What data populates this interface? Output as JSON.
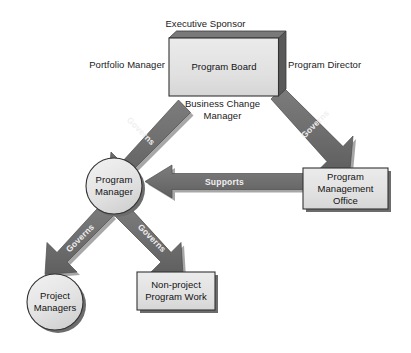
{
  "diagram": {
    "type": "organizational-flow-diagram",
    "colors": {
      "node_fill": "#e2e2e2",
      "node_fill_light": "#ededed",
      "node_border": "#3a3a3a",
      "shadow": "#6e6e6e",
      "arrow": "#706f70",
      "arrow_dark": "#5b5a5b",
      "text": "#161616",
      "arrow_label_text": "#f0f0f0",
      "background": "#ffffff"
    },
    "nodes": [
      {
        "id": "program-board",
        "shape": "box",
        "label": "Program Board"
      },
      {
        "id": "program-manager",
        "shape": "circle",
        "label_line1": "Program",
        "label_line2": "Manager"
      },
      {
        "id": "program-management-office",
        "shape": "box",
        "label_line1": "Program",
        "label_line2": "Management",
        "label_line3": "Office"
      },
      {
        "id": "project-managers",
        "shape": "circle",
        "label_line1": "Project",
        "label_line2": "Managers"
      },
      {
        "id": "non-project-program-work",
        "shape": "box",
        "label_line1": "Non-project",
        "label_line2": "Program Work"
      }
    ],
    "annotations": [
      {
        "id": "executive-sponsor",
        "text": "Executive Sponsor",
        "position": "above-program-board"
      },
      {
        "id": "portfolio-manager",
        "text": "Portfolio Manager",
        "position": "left-of-program-board"
      },
      {
        "id": "program-director",
        "text": "Program Director",
        "position": "right-of-program-board"
      },
      {
        "id": "business-change-manager-line1",
        "text": "Business Change",
        "position": "below-program-board"
      },
      {
        "id": "business-change-manager-line2",
        "text": "Manager",
        "position": "below-program-board"
      }
    ],
    "edges": [
      {
        "id": "board-to-manager",
        "from": "program-board",
        "to": "program-manager",
        "label": "Governs"
      },
      {
        "id": "board-to-pmo",
        "from": "program-board",
        "to": "program-management-office",
        "label": "Governs"
      },
      {
        "id": "pmo-to-manager",
        "from": "program-management-office",
        "to": "program-manager",
        "label": "Supports"
      },
      {
        "id": "manager-to-project-managers",
        "from": "program-manager",
        "to": "project-managers",
        "label": "Governs"
      },
      {
        "id": "manager-to-non-project",
        "from": "program-manager",
        "to": "non-project-program-work",
        "label": "Governs"
      }
    ]
  }
}
